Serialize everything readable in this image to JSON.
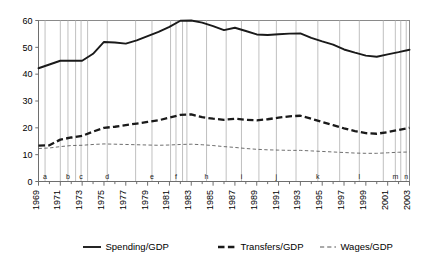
{
  "chart_data": {
    "type": "line",
    "title": "",
    "subtitle": "",
    "xlabel": "",
    "ylabel": "",
    "xlim": [
      1969,
      2003
    ],
    "ylim": [
      0,
      60
    ],
    "yticks": [
      0,
      10,
      20,
      30,
      40,
      50,
      60
    ],
    "xticks": [
      1969,
      1971,
      1973,
      1975,
      1977,
      1979,
      1981,
      1983,
      1985,
      1987,
      1989,
      1991,
      1993,
      1995,
      1997,
      1999,
      2001,
      2003
    ],
    "xticks_minor_every": 1,
    "grid": false,
    "legend_position": "bottom",
    "x": [
      1969,
      1970,
      1971,
      1972,
      1973,
      1974,
      1975,
      1976,
      1977,
      1978,
      1979,
      1980,
      1981,
      1982,
      1983,
      1984,
      1985,
      1986,
      1987,
      1988,
      1989,
      1990,
      1991,
      1992,
      1993,
      1994,
      1995,
      1996,
      1997,
      1998,
      1999,
      2000,
      2001,
      2002,
      2003
    ],
    "series": [
      {
        "name": "Spending/GDP",
        "style": "solid",
        "values": [
          42.2,
          43.6,
          45.0,
          45.0,
          45.0,
          47.6,
          52.0,
          51.8,
          51.4,
          52.6,
          54.2,
          55.8,
          57.6,
          59.9,
          60.0,
          59.2,
          57.9,
          56.4,
          57.3,
          56.1,
          54.8,
          54.6,
          54.9,
          55.1,
          55.2,
          53.5,
          52.2,
          51.0,
          49.2,
          48.0,
          46.9,
          46.5,
          47.4,
          48.2,
          49.1
        ]
      },
      {
        "name": "Transfers/GDP",
        "style": "thick-dashed",
        "values": [
          13.4,
          13.5,
          15.6,
          16.4,
          17.0,
          18.6,
          20.0,
          20.4,
          21.0,
          21.6,
          22.2,
          22.8,
          23.8,
          24.8,
          25.0,
          24.0,
          23.4,
          23.0,
          23.4,
          23.0,
          22.8,
          23.2,
          23.8,
          24.3,
          24.5,
          23.4,
          22.2,
          21.0,
          19.8,
          18.8,
          18.0,
          17.8,
          18.4,
          19.2,
          20.0
        ]
      },
      {
        "name": "Wages/GDP",
        "style": "thin-dashed",
        "values": [
          12.3,
          12.5,
          13.0,
          13.4,
          13.5,
          13.8,
          14.0,
          13.9,
          13.8,
          13.7,
          13.6,
          13.5,
          13.6,
          13.8,
          13.9,
          13.7,
          13.4,
          13.0,
          12.7,
          12.3,
          12.0,
          11.8,
          11.7,
          11.6,
          11.6,
          11.4,
          11.2,
          11.0,
          10.8,
          10.6,
          10.5,
          10.5,
          10.7,
          10.9,
          11.0
        ]
      }
    ],
    "event_markers": [
      {
        "label": "a",
        "year": 1969.6
      },
      {
        "label": "",
        "year": 1971.0
      },
      {
        "label": "b",
        "year": 1971.7
      },
      {
        "label": "",
        "year": 1972.4
      },
      {
        "label": "c",
        "year": 1972.9
      },
      {
        "label": "",
        "year": 1973.5
      },
      {
        "label": "d",
        "year": 1975.3
      },
      {
        "label": "",
        "year": 1977.9
      },
      {
        "label": "e",
        "year": 1979.4
      },
      {
        "label": "",
        "year": 1981.1
      },
      {
        "label": "f",
        "year": 1981.6
      },
      {
        "label": "",
        "year": 1982.2
      },
      {
        "label": "",
        "year": 1982.6
      },
      {
        "label": "h",
        "year": 1984.4
      },
      {
        "label": "",
        "year": 1986.2
      },
      {
        "label": "i",
        "year": 1987.6
      },
      {
        "label": "",
        "year": 1989.2
      },
      {
        "label": "j",
        "year": 1990.8
      },
      {
        "label": "",
        "year": 1992.6
      },
      {
        "label": "k",
        "year": 1994.6
      },
      {
        "label": "",
        "year": 1996.6
      },
      {
        "label": "l",
        "year": 1998.4
      },
      {
        "label": "",
        "year": 2000.6
      },
      {
        "label": "m",
        "year": 2001.7
      },
      {
        "label": "",
        "year": 2002.2
      },
      {
        "label": "n",
        "year": 2002.7
      }
    ],
    "marker_labels": [
      "a",
      "b",
      "c",
      "d",
      "e",
      "f",
      "h",
      "i",
      "j",
      "k",
      "l",
      "m",
      "n"
    ],
    "colors": {
      "spending": "#1a1a1a",
      "transfers": "#1a1a1a",
      "wages": "#555555",
      "marker_line": "#b9b9b9",
      "axis": "#6e6e6e",
      "frame": "#8a8a8a",
      "background": "#ffffff"
    }
  },
  "legend": {
    "items": [
      {
        "label": "Spending/GDP",
        "style": "solid"
      },
      {
        "label": "Transfers/GDP",
        "style": "thick-dashed"
      },
      {
        "label": "Wages/GDP",
        "style": "thin-dashed"
      }
    ]
  }
}
